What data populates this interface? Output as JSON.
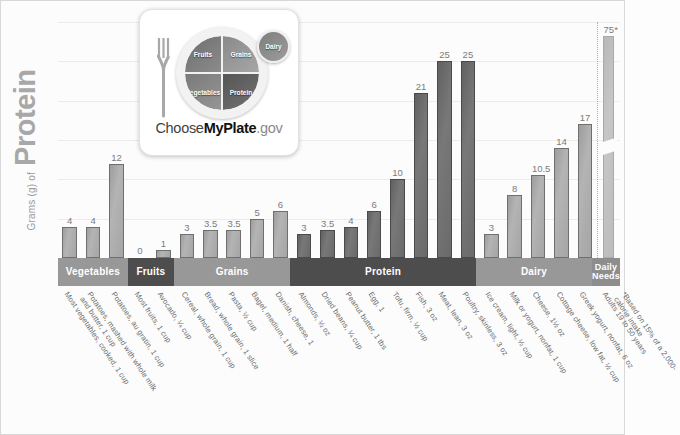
{
  "axis": {
    "y_title_small": "Grams (g) of",
    "y_title_big": "Protein"
  },
  "logo": {
    "name": "myplate-logo",
    "plate_sections": [
      "Fruits",
      "Grains",
      "Vegetables",
      "Protein"
    ],
    "dairy_label": "Dairy",
    "wordmark_pre": "Choose",
    "wordmark_bold": "MyPlate",
    "wordmark_post": ".gov"
  },
  "bands": [
    {
      "label": "Vegetables",
      "span": 3,
      "tone": "light"
    },
    {
      "label": "Fruits",
      "span": 2,
      "tone": "dark"
    },
    {
      "label": "Grains",
      "span": 5,
      "tone": "light"
    },
    {
      "label": "Protein",
      "span": 8,
      "tone": "dark"
    },
    {
      "label": "Dairy",
      "span": 5,
      "tone": "light"
    },
    {
      "label": "Daily\nNeeds",
      "span": 1,
      "tone": "mid"
    }
  ],
  "chart_data": {
    "type": "bar",
    "title": "Grams (g) of Protein",
    "xlabel": "",
    "ylabel": "Grams (g) of Protein",
    "ylim": [
      0,
      30
    ],
    "grid": true,
    "gridline_step": 5,
    "legend": "none",
    "categories": [
      "Most vegetables, cooked, 1 cup",
      "Potatoes, mashed with whole milk and butter, 1 cup",
      "Potatoes, au gratin, 1 cup",
      "Most fruits, 1 cup",
      "Avocado, ¼ cup",
      "Cereal, whole grain, 1 cup",
      "Bread, whole grain, 1 slice",
      "Pasta, ½ cup",
      "Bagel, medium, 1 half",
      "Danish, cheese, 1",
      "Almonds, ½ oz",
      "Dried beans, ¼ cup",
      "Peanut butter, 1 tbs",
      "Egg, 1",
      "Tofu, firm, ½ cup",
      "Fish, 3 oz",
      "Meat, lean, 3 oz",
      "Poultry, skinless, 3 oz",
      "Ice cream, light, ½ cup",
      "Milk or yogurt, nonfat, 1 cup",
      "Cheese, 1½ oz",
      "Cottage cheese, low fat, ½ cup",
      "Greek yogurt, nonfat, 6 oz",
      "Adults 19 to 50 years"
    ],
    "values": [
      4,
      4,
      12,
      0,
      1,
      3,
      3.5,
      3.5,
      5,
      6,
      3,
      3.5,
      4,
      6,
      10,
      21,
      25,
      25,
      3,
      8,
      10.5,
      14,
      17,
      75
    ],
    "value_labels": [
      "4",
      "4",
      "12",
      "0",
      "1",
      "3",
      "3.5",
      "3.5",
      "5",
      "6",
      "3",
      "3.5",
      "4",
      "6",
      "10",
      "21",
      "25",
      "25",
      "3",
      "8",
      "10.5",
      "14",
      "17",
      "75*"
    ],
    "groups": [
      "Vegetables",
      "Vegetables",
      "Vegetables",
      "Fruits",
      "Fruits",
      "Grains",
      "Grains",
      "Grains",
      "Grains",
      "Grains",
      "Protein",
      "Protein",
      "Protein",
      "Protein",
      "Protein",
      "Protein",
      "Protein",
      "Protein",
      "Dairy",
      "Dairy",
      "Dairy",
      "Dairy",
      "Dairy",
      "Daily Needs"
    ],
    "broken_axis_bar_index": 23,
    "annotations": [
      "*Based on 15% of a 2,000-calorie intake"
    ]
  },
  "footnote": "*Based on 15% of a 2,000-calorie intake",
  "colors": {
    "bar_light": "#a5a5a5",
    "bar_dark": "#6a6a6a",
    "bar_needs": "#bcbcbc",
    "band_light": "#989898",
    "band_dark": "#4d4d4d",
    "band_mid": "#8d8d8d",
    "gridline": "#ececec",
    "background": "#fcfcfc",
    "text": "#6b6b6b"
  }
}
